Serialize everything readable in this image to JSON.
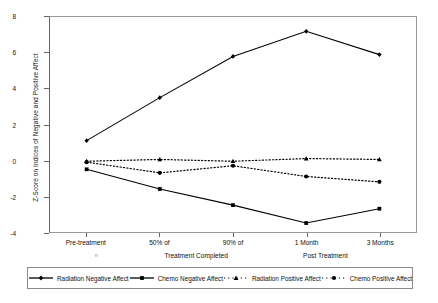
{
  "chart_data": {
    "type": "line",
    "title": "",
    "xlabel": "",
    "ylabel": "Z-Score on Indices of Negative and Positive Affect",
    "categories": [
      "Pre-treatment",
      "50% of",
      "90% of",
      "1 Month",
      "3 Months"
    ],
    "category_groups": [
      "",
      "Treatment Completed",
      "Treatment Completed",
      "Post Treatment",
      "Post Treatment"
    ],
    "group_labels": [
      "Treatment Completed",
      "Post Treatment"
    ],
    "ylim": [
      -4,
      8
    ],
    "yticks": [
      8,
      6,
      4,
      2,
      0,
      -2,
      -4
    ],
    "ytick_labels": [
      "8",
      "6",
      "4",
      "2",
      "0",
      "-2",
      "-4"
    ],
    "grid": false,
    "legend_position": "bottom",
    "series": [
      {
        "name": "Radiation Negative Affect",
        "values": [
          1.1,
          3.5,
          5.8,
          7.2,
          5.9
        ],
        "style": "solid",
        "marker": "diamond",
        "color": "#000000"
      },
      {
        "name": "Chemo Negative Affect",
        "values": [
          -0.5,
          -1.6,
          -2.5,
          -3.5,
          -2.7
        ],
        "style": "solid",
        "marker": "square",
        "color": "#000000"
      },
      {
        "name": "Radiation Positive Affect",
        "values": [
          -0.05,
          0.05,
          -0.05,
          0.1,
          0.05
        ],
        "style": "dotted",
        "marker": "triangle",
        "color": "#000000"
      },
      {
        "name": "Chemo Positive Affect",
        "values": [
          -0.1,
          -0.7,
          -0.3,
          -0.9,
          -1.2
        ],
        "style": "dotted",
        "marker": "circle",
        "color": "#000000"
      }
    ]
  },
  "axis": {
    "stray_marker": "n"
  }
}
